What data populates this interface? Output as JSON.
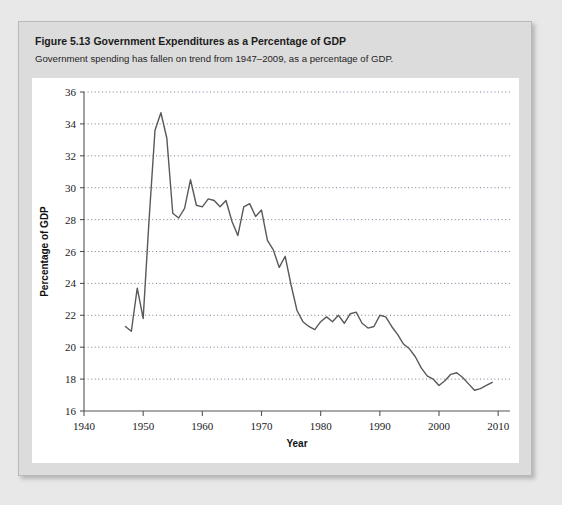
{
  "figure": {
    "number": "Figure 5.13",
    "title": "Government Expenditures as a Percentage of GDP",
    "subtitle": "Government spending has fallen on trend from 1947–2009, as a percentage of GDP."
  },
  "colors": {
    "page_background": "#e8e8e8",
    "panel_background": "#dcdcdc",
    "panel_border": "#b9b9b9",
    "plot_background": "#ffffff",
    "line": "#595959",
    "gridline": "#7a7a99",
    "axis": "#555555",
    "text": "#1a1a1a"
  },
  "chart_data": {
    "type": "line",
    "title": "Government Expenditures as a Percentage of GDP",
    "xlabel": "Year",
    "ylabel": "Percentage of GDP",
    "xlim": [
      1940,
      2012
    ],
    "ylim": [
      16,
      36
    ],
    "xticks": [
      1940,
      1950,
      1960,
      1970,
      1980,
      1990,
      2000,
      2010
    ],
    "yticks": [
      16,
      18,
      20,
      22,
      24,
      26,
      28,
      30,
      32,
      34,
      36
    ],
    "grid": "horizontal-dotted",
    "legend": "none",
    "series": [
      {
        "name": "Government Expenditures (% of GDP)",
        "x": [
          1947,
          1948,
          1949,
          1950,
          1951,
          1952,
          1953,
          1954,
          1955,
          1956,
          1957,
          1958,
          1959,
          1960,
          1961,
          1962,
          1963,
          1964,
          1965,
          1966,
          1967,
          1968,
          1969,
          1970,
          1971,
          1972,
          1973,
          1974,
          1975,
          1976,
          1977,
          1978,
          1979,
          1980,
          1981,
          1982,
          1983,
          1984,
          1985,
          1986,
          1987,
          1988,
          1989,
          1990,
          1991,
          1992,
          1993,
          1994,
          1995,
          1996,
          1997,
          1998,
          1999,
          2000,
          2001,
          2002,
          2003,
          2004,
          2005,
          2006,
          2007,
          2008,
          2009
        ],
        "y": [
          21.3,
          21.0,
          23.7,
          21.8,
          28.0,
          33.6,
          34.7,
          33.1,
          28.4,
          28.1,
          28.7,
          30.5,
          28.9,
          28.8,
          29.3,
          29.2,
          28.8,
          29.2,
          27.9,
          27.0,
          28.8,
          29.0,
          28.2,
          28.6,
          26.7,
          26.1,
          25.0,
          25.7,
          23.9,
          22.3,
          21.6,
          21.3,
          21.1,
          21.6,
          21.9,
          21.6,
          22.0,
          21.5,
          22.1,
          22.2,
          21.5,
          21.2,
          21.3,
          22.0,
          21.9,
          21.3,
          20.8,
          20.2,
          19.9,
          19.4,
          18.7,
          18.2,
          18.0,
          17.6,
          17.9,
          18.3,
          18.4,
          18.1,
          17.7,
          17.3,
          17.4,
          17.6,
          17.8
        ]
      }
    ]
  }
}
